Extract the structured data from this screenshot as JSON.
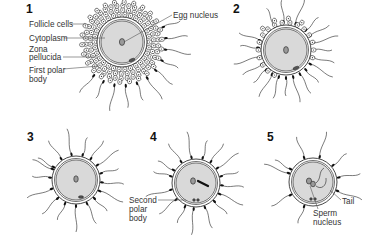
{
  "diagram": {
    "colors": {
      "line": "#333333",
      "cytoplasm": "#d9d9d9",
      "nucleus": "#9a9a9a",
      "sperm_head": "#111111",
      "label_text": "#333333"
    },
    "stages": [
      {
        "number": "1",
        "num_pos": [
          26,
          13
        ],
        "egg": {
          "cx": 122,
          "cy": 42,
          "r": 21,
          "zona": 25
        },
        "follicle": {
          "inner": 27,
          "outer": 40
        },
        "labels": [
          {
            "text": "Follicle cells",
            "x": 29,
            "y": 27,
            "line": [
              71,
              24,
              86,
              24
            ]
          },
          {
            "text": "Cytoplasm",
            "x": 29,
            "y": 41,
            "line": [
              64,
              38,
              105,
              38
            ]
          },
          {
            "text": "Zona",
            "x": 29,
            "y": 52
          },
          {
            "text": "pellucida",
            "x": 29,
            "y": 60,
            "line": [
              63,
              57,
              98,
              57
            ]
          },
          {
            "text": "First polar",
            "x": 29,
            "y": 73,
            "line": [
              63,
              69,
              99,
              66
            ]
          },
          {
            "text": "body",
            "x": 29,
            "y": 82
          },
          {
            "text": "Egg nucleus",
            "x": 173,
            "y": 18,
            "line": [
              172,
              15,
              124,
              42
            ]
          }
        ]
      },
      {
        "number": "2",
        "num_pos": [
          233,
          13
        ],
        "egg": {
          "cx": 286,
          "cy": 50,
          "r": 21,
          "zona": 25
        },
        "labels": []
      },
      {
        "number": "3",
        "num_pos": [
          27,
          141
        ],
        "egg": {
          "cx": 76,
          "cy": 180,
          "r": 20,
          "zona": 24
        },
        "labels": []
      },
      {
        "number": "4",
        "num_pos": [
          150,
          141
        ],
        "egg": {
          "cx": 196,
          "cy": 183,
          "r": 20,
          "zona": 24
        },
        "labels": [
          {
            "text": "Second",
            "x": 129,
            "y": 203,
            "line": [
              158,
              200,
              186,
              200
            ]
          },
          {
            "text": "polar",
            "x": 129,
            "y": 212
          },
          {
            "text": "body",
            "x": 129,
            "y": 221
          }
        ]
      },
      {
        "number": "5",
        "num_pos": [
          267,
          141
        ],
        "egg": {
          "cx": 313,
          "cy": 182,
          "r": 20,
          "zona": 24
        },
        "labels": [
          {
            "text": "Tail",
            "x": 342,
            "y": 204,
            "line": [
              341,
              200,
              330,
              190
            ]
          },
          {
            "text": "Sperm",
            "x": 313,
            "y": 216
          },
          {
            "text": "nucleus",
            "x": 313,
            "y": 225,
            "line": [
              318,
              209,
              310,
              186
            ]
          }
        ]
      }
    ]
  }
}
